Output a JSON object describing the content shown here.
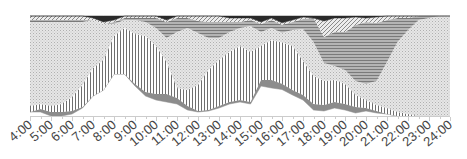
{
  "chart_data": {
    "type": "area",
    "stacked": "percent",
    "title": "",
    "xlabel": "",
    "ylabel": "",
    "grid": false,
    "legend": "none",
    "x_tick_labels": [
      "4:00",
      "5:00",
      "6:00",
      "7:00",
      "8:00",
      "9:00",
      "10:00",
      "11:00",
      "12:00",
      "13:00",
      "14:00",
      "15:00",
      "16:00",
      "17:00",
      "18:00",
      "19:00",
      "20:00",
      "21:00",
      "22:00",
      "23:00",
      "24:00"
    ],
    "xlim": [
      4,
      24
    ],
    "ylim": [
      0,
      100
    ],
    "x": [
      4,
      4.5,
      5,
      5.5,
      6,
      6.5,
      7,
      7.5,
      8,
      8.5,
      9,
      9.5,
      10,
      10.5,
      11,
      11.5,
      12,
      12.5,
      13,
      13.5,
      14,
      14.5,
      15,
      15.5,
      16,
      16.5,
      17,
      17.5,
      18,
      18.5,
      19,
      19.5,
      20,
      20.5,
      21,
      21.5,
      22,
      22.5,
      23,
      23.5,
      24
    ],
    "series": [
      {
        "name": "blank",
        "pattern": "solid",
        "color": "#ffffff",
        "values": [
          4,
          4,
          0,
          0,
          2,
          8,
          20,
          26,
          42,
          42,
          30,
          20,
          16,
          14,
          12,
          6,
          4,
          5,
          8,
          12,
          14,
          12,
          30,
          28,
          27,
          21,
          16,
          6,
          5,
          8,
          6,
          3,
          5,
          3,
          2,
          0,
          0,
          0,
          0,
          0,
          0
        ]
      },
      {
        "name": "dense",
        "pattern": "solid",
        "color": "#8c8c8c",
        "values": [
          0,
          3,
          4,
          4,
          3,
          1,
          0,
          0,
          0,
          0,
          2,
          4,
          6,
          8,
          6,
          4,
          1,
          1,
          2,
          2,
          2,
          2,
          6,
          8,
          6,
          5,
          5,
          6,
          6,
          6,
          6,
          6,
          3,
          2,
          0,
          0,
          0,
          0,
          0,
          0,
          0
        ]
      },
      {
        "name": "vertical",
        "pattern": "vertical-lines",
        "color": "#777777",
        "values": [
          6,
          5,
          6,
          8,
          14,
          22,
          28,
          30,
          38,
          46,
          50,
          56,
          48,
          32,
          10,
          16,
          26,
          40,
          46,
          50,
          54,
          50,
          34,
          40,
          42,
          44,
          34,
          28,
          24,
          22,
          20,
          12,
          8,
          6,
          6,
          4,
          2,
          0,
          0,
          0,
          0
        ]
      },
      {
        "name": "dotted",
        "pattern": "dots",
        "color": "#bbbbbb",
        "values": [
          84,
          82,
          84,
          82,
          75,
          63,
          48,
          36,
          12,
          8,
          14,
          14,
          18,
          24,
          56,
          62,
          52,
          32,
          22,
          20,
          18,
          26,
          14,
          12,
          10,
          16,
          32,
          34,
          18,
          14,
          14,
          14,
          16,
          24,
          46,
          70,
          84,
          96,
          98,
          100,
          100
        ]
      },
      {
        "name": "horizontal",
        "pattern": "horizontal-lines",
        "color": "#909090",
        "values": [
          2,
          2,
          2,
          2,
          2,
          2,
          0,
          0,
          2,
          2,
          2,
          4,
          10,
          16,
          14,
          10,
          12,
          16,
          16,
          10,
          6,
          6,
          8,
          8,
          8,
          8,
          10,
          24,
          26,
          34,
          38,
          56,
          62,
          58,
          42,
          24,
          12,
          4,
          2,
          0,
          0
        ]
      },
      {
        "name": "diagonal",
        "pattern": "diagonal-lines",
        "color": "#999999",
        "values": [
          4,
          4,
          4,
          4,
          4,
          4,
          2,
          2,
          2,
          2,
          2,
          2,
          2,
          2,
          2,
          2,
          5,
          6,
          6,
          4,
          4,
          2,
          2,
          2,
          2,
          2,
          2,
          0,
          16,
          14,
          14,
          8,
          4,
          6,
          4,
          2,
          2,
          0,
          0,
          0,
          0
        ]
      },
      {
        "name": "dark",
        "pattern": "solid",
        "color": "#2a2a2a",
        "values": [
          0,
          0,
          0,
          0,
          0,
          0,
          2,
          6,
          4,
          0,
          0,
          0,
          0,
          4,
          0,
          0,
          0,
          0,
          0,
          2,
          2,
          2,
          6,
          2,
          7,
          4,
          1,
          2,
          5,
          2,
          2,
          1,
          2,
          1,
          0,
          0,
          0,
          0,
          0,
          0,
          0
        ]
      }
    ]
  }
}
